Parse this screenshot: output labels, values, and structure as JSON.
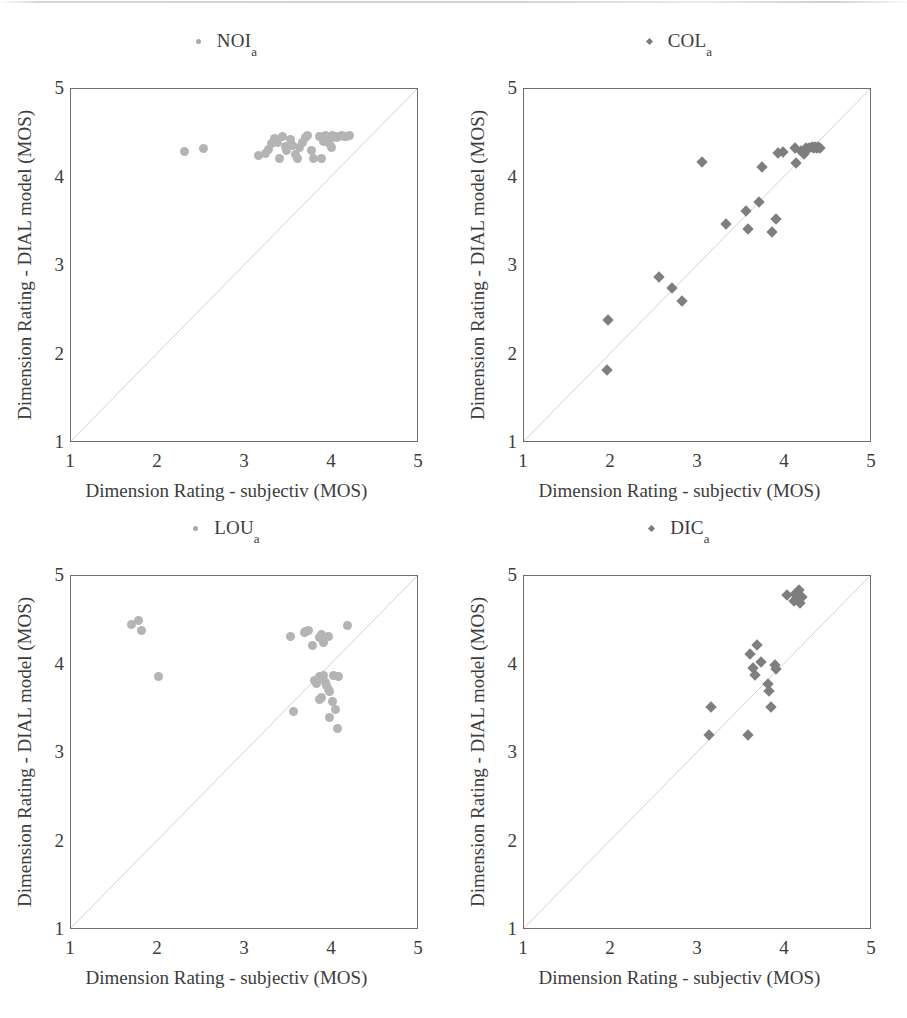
{
  "figure": {
    "background": "#ffffff",
    "text_color": "#3c3c3c",
    "axis_color": "#6e6e6e",
    "diagonal_color": "#d2d2d2",
    "circle_marker_color": "#b4b4b4",
    "diamond_marker_color": "#7e7e7e"
  },
  "axes_common": {
    "xlabel": "Dimension Rating - subjectiv (MOS)",
    "ylabel": "Dimension Rating - DIAL model (MOS)",
    "xticks": [
      "1",
      "2",
      "3",
      "4",
      "5"
    ],
    "yticks": [
      "5",
      "4",
      "3",
      "2",
      "1"
    ],
    "xlim": [
      1,
      5
    ],
    "ylim": [
      1,
      5
    ],
    "identity_line": true,
    "grid": false
  },
  "chart_data": [
    {
      "type": "scatter",
      "title": "NOI",
      "title_subscript": "a",
      "marker": "circle",
      "marker_color": "#b4b4b4",
      "xlabel": "Dimension Rating - subjectiv (MOS)",
      "ylabel": "Dimension Rating - DIAL model (MOS)",
      "xlim": [
        1,
        5
      ],
      "ylim": [
        1,
        5
      ],
      "xticks": [
        1,
        2,
        3,
        4,
        5
      ],
      "yticks": [
        1,
        2,
        3,
        4,
        5
      ],
      "identity_line": true,
      "points": [
        [
          2.31,
          4.29
        ],
        [
          2.52,
          4.33
        ],
        [
          3.16,
          4.25
        ],
        [
          3.23,
          4.27
        ],
        [
          3.27,
          4.32
        ],
        [
          3.31,
          4.38
        ],
        [
          3.34,
          4.44
        ],
        [
          3.37,
          4.4
        ],
        [
          3.4,
          4.22
        ],
        [
          3.43,
          4.46
        ],
        [
          3.46,
          4.35
        ],
        [
          3.48,
          4.31
        ],
        [
          3.52,
          4.43
        ],
        [
          3.55,
          4.36
        ],
        [
          3.58,
          4.26
        ],
        [
          3.6,
          4.21
        ],
        [
          3.63,
          4.34
        ],
        [
          3.66,
          4.4
        ],
        [
          3.69,
          4.45
        ],
        [
          3.72,
          4.47
        ],
        [
          3.76,
          4.31
        ],
        [
          3.79,
          4.22
        ],
        [
          3.86,
          4.46
        ],
        [
          3.9,
          4.41
        ],
        [
          3.93,
          4.47
        ],
        [
          3.95,
          4.44
        ],
        [
          3.97,
          4.38
        ],
        [
          3.99,
          4.34
        ],
        [
          4.0,
          4.47
        ],
        [
          4.03,
          4.46
        ],
        [
          4.05,
          4.45
        ],
        [
          4.08,
          4.46
        ],
        [
          4.11,
          4.47
        ],
        [
          4.14,
          4.46
        ],
        [
          4.17,
          4.46
        ],
        [
          4.2,
          4.47
        ],
        [
          3.88,
          4.21
        ]
      ]
    },
    {
      "type": "scatter",
      "title": "COL",
      "title_subscript": "a",
      "marker": "diamond",
      "marker_color": "#7e7e7e",
      "xlabel": "Dimension Rating - subjectiv (MOS)",
      "ylabel": "Dimension Rating - DIAL model (MOS)",
      "xlim": [
        1,
        5
      ],
      "ylim": [
        1,
        5
      ],
      "xticks": [
        1,
        2,
        3,
        4,
        5
      ],
      "yticks": [
        1,
        2,
        3,
        4,
        5
      ],
      "identity_line": true,
      "points": [
        [
          1.95,
          1.82
        ],
        [
          1.97,
          2.39
        ],
        [
          2.55,
          2.88
        ],
        [
          2.7,
          2.75
        ],
        [
          2.82,
          2.6
        ],
        [
          3.05,
          4.17
        ],
        [
          3.32,
          3.48
        ],
        [
          3.55,
          3.62
        ],
        [
          3.58,
          3.42
        ],
        [
          3.7,
          3.72
        ],
        [
          3.73,
          4.12
        ],
        [
          3.85,
          3.38
        ],
        [
          3.9,
          3.53
        ],
        [
          3.92,
          4.28
        ],
        [
          3.98,
          4.29
        ],
        [
          4.12,
          4.33
        ],
        [
          4.13,
          4.16
        ],
        [
          4.18,
          4.3
        ],
        [
          4.22,
          4.26
        ],
        [
          4.24,
          4.33
        ],
        [
          4.28,
          4.33
        ],
        [
          4.31,
          4.34
        ],
        [
          4.33,
          4.33
        ],
        [
          4.35,
          4.34
        ],
        [
          4.37,
          4.33
        ],
        [
          4.38,
          4.34
        ],
        [
          4.4,
          4.33
        ]
      ]
    },
    {
      "type": "scatter",
      "title": "LOU",
      "title_subscript": "a",
      "marker": "circle",
      "marker_color": "#b4b4b4",
      "xlabel": "Dimension Rating - subjectiv (MOS)",
      "ylabel": "Dimension Rating - DIAL model (MOS)",
      "xlim": [
        1,
        5
      ],
      "ylim": [
        1,
        5
      ],
      "xticks": [
        1,
        2,
        3,
        4,
        5
      ],
      "yticks": [
        1,
        2,
        3,
        4,
        5
      ],
      "identity_line": true,
      "points": [
        [
          1.7,
          4.45
        ],
        [
          1.78,
          4.5
        ],
        [
          1.81,
          4.38
        ],
        [
          2.0,
          3.86
        ],
        [
          3.52,
          4.32
        ],
        [
          3.68,
          4.36
        ],
        [
          3.7,
          4.37
        ],
        [
          3.73,
          4.38
        ],
        [
          3.78,
          4.22
        ],
        [
          3.86,
          4.31
        ],
        [
          3.88,
          4.34
        ],
        [
          3.9,
          4.25
        ],
        [
          3.96,
          4.32
        ],
        [
          4.18,
          4.44
        ],
        [
          3.82,
          3.79
        ],
        [
          3.86,
          3.86
        ],
        [
          3.88,
          3.84
        ],
        [
          3.9,
          3.88
        ],
        [
          3.92,
          3.8
        ],
        [
          3.94,
          3.76
        ],
        [
          3.96,
          3.72
        ],
        [
          3.97,
          3.7
        ],
        [
          4.02,
          3.88
        ],
        [
          3.8,
          3.82
        ],
        [
          3.86,
          3.61
        ],
        [
          3.88,
          3.63
        ],
        [
          4.0,
          3.58
        ],
        [
          4.04,
          3.49
        ],
        [
          3.97,
          3.4
        ],
        [
          4.06,
          3.28
        ],
        [
          3.56,
          3.47
        ],
        [
          4.08,
          3.86
        ]
      ]
    },
    {
      "type": "scatter",
      "title": "DIC",
      "title_subscript": "a",
      "marker": "diamond",
      "marker_color": "#7e7e7e",
      "xlabel": "Dimension Rating - subjectiv (MOS)",
      "ylabel": "Dimension Rating - DIAL model (MOS)",
      "xlim": [
        1,
        5
      ],
      "ylim": [
        1,
        5
      ],
      "xticks": [
        1,
        2,
        3,
        4,
        5
      ],
      "yticks": [
        1,
        2,
        3,
        4,
        5
      ],
      "identity_line": true,
      "points": [
        [
          3.13,
          3.2
        ],
        [
          3.15,
          3.52
        ],
        [
          3.58,
          3.2
        ],
        [
          3.6,
          4.12
        ],
        [
          3.63,
          3.96
        ],
        [
          3.65,
          3.88
        ],
        [
          3.68,
          4.22
        ],
        [
          3.72,
          4.03
        ],
        [
          3.8,
          3.78
        ],
        [
          3.82,
          3.7
        ],
        [
          3.84,
          3.52
        ],
        [
          3.88,
          4.0
        ],
        [
          3.9,
          3.95
        ],
        [
          4.02,
          4.78
        ],
        [
          4.1,
          4.72
        ],
        [
          4.12,
          4.8
        ],
        [
          4.14,
          4.75
        ],
        [
          4.16,
          4.84
        ],
        [
          4.17,
          4.7
        ],
        [
          4.19,
          4.76
        ]
      ]
    }
  ]
}
